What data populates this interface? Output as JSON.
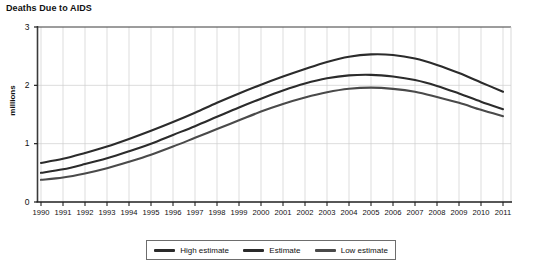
{
  "chart_data": {
    "type": "line",
    "title": "Deaths Due to AIDS",
    "xlabel": "",
    "ylabel": "millions",
    "ylim": [
      0,
      3
    ],
    "yticks": [
      "0",
      "1",
      "2",
      "3"
    ],
    "grid": true,
    "legend_position": "bottom",
    "categories": [
      "1990",
      "1991",
      "1992",
      "1993",
      "1994",
      "1995",
      "1996",
      "1997",
      "1998",
      "1999",
      "2000",
      "2001",
      "2002",
      "2003",
      "2004",
      "2005",
      "2006",
      "2007",
      "2008",
      "2009",
      "2010",
      "2011"
    ],
    "series": [
      {
        "name": "High estimate",
        "color": "#2b2b2b",
        "values": [
          0.67,
          0.74,
          0.84,
          0.95,
          1.08,
          1.22,
          1.37,
          1.53,
          1.7,
          1.86,
          2.01,
          2.15,
          2.28,
          2.4,
          2.49,
          2.53,
          2.52,
          2.46,
          2.35,
          2.21,
          2.05,
          1.89
        ]
      },
      {
        "name": "Estimate",
        "color": "#2b2b2b",
        "values": [
          0.5,
          0.56,
          0.65,
          0.75,
          0.87,
          1.0,
          1.15,
          1.3,
          1.46,
          1.62,
          1.77,
          1.91,
          2.03,
          2.12,
          2.17,
          2.18,
          2.15,
          2.09,
          1.99,
          1.86,
          1.72,
          1.59
        ]
      },
      {
        "name": "Low estimate",
        "color": "#4a4a4a",
        "values": [
          0.38,
          0.42,
          0.49,
          0.58,
          0.69,
          0.81,
          0.95,
          1.1,
          1.25,
          1.4,
          1.55,
          1.68,
          1.79,
          1.88,
          1.94,
          1.96,
          1.94,
          1.89,
          1.8,
          1.7,
          1.58,
          1.47
        ]
      }
    ],
    "legend": [
      {
        "label": "High estimate",
        "color": "#2b2b2b"
      },
      {
        "label": "Estimate",
        "color": "#2b2b2b"
      },
      {
        "label": "Low estimate",
        "color": "#4a4a4a"
      }
    ]
  },
  "style": {
    "axis_color": "#555555",
    "grid_color": "#cfcfcf",
    "plot_bg": "#ffffff"
  }
}
